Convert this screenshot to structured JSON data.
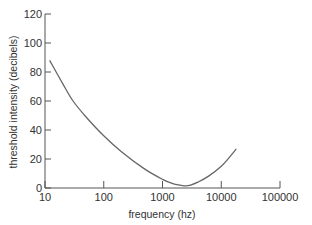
{
  "chart_data": {
    "type": "line",
    "title": "",
    "xlabel": "frequency (hz)",
    "ylabel": "threshold intensity (decibels)",
    "xscale": "log",
    "xlim": [
      10,
      100000
    ],
    "ylim": [
      0,
      120
    ],
    "x_ticks": [
      "10",
      "100",
      "1000",
      "10000",
      "100000"
    ],
    "y_ticks": [
      "0",
      "20",
      "40",
      "60",
      "80",
      "100",
      "120"
    ],
    "grid": false,
    "legend": null,
    "series": [
      {
        "name": "hearing threshold",
        "x": [
          12,
          20,
          30,
          50,
          100,
          200,
          500,
          1000,
          1500,
          2000,
          2500,
          3000,
          4000,
          6000,
          10000,
          15000,
          18000
        ],
        "y": [
          88,
          72,
          60,
          49,
          36,
          25,
          13,
          6,
          3,
          2,
          1.5,
          2,
          4,
          8,
          15,
          23,
          27
        ]
      }
    ]
  }
}
